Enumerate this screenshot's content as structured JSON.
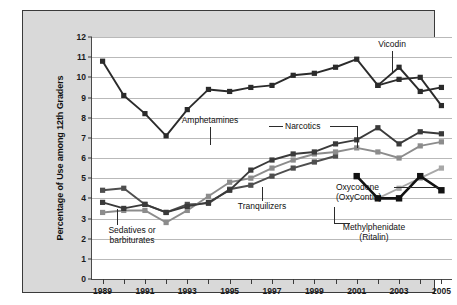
{
  "chart_data": {
    "type": "line",
    "title": "",
    "xlabel": "",
    "ylabel": "Percentage of Use among 12th Graders",
    "xlim": [
      1988.5,
      2005.5
    ],
    "ylim": [
      0,
      12
    ],
    "grid": true,
    "legend_position": "inline-annotations",
    "x": [
      1989,
      1990,
      1991,
      1992,
      1993,
      1994,
      1995,
      1996,
      1997,
      1998,
      1999,
      2000,
      2001,
      2002,
      2003,
      2004,
      2005
    ],
    "ytick_labels": [
      "0",
      "1",
      "2",
      "3",
      "4",
      "5",
      "6",
      "7",
      "8",
      "9",
      "10",
      "11",
      "12"
    ],
    "xtick_labels": [
      "1989",
      "1991",
      "1993",
      "1995",
      "1997",
      "1999",
      "2001",
      "2003",
      "2005"
    ],
    "series": [
      {
        "name": "Amphetamines",
        "color": "#2b2b2b",
        "marker": "square",
        "x": [
          1989,
          1990,
          1991,
          1992,
          1993,
          1994,
          1995,
          1996,
          1997,
          1998,
          1999,
          2000,
          2001,
          2002,
          2003,
          2004,
          2005
        ],
        "values": [
          10.8,
          9.1,
          8.2,
          7.1,
          8.4,
          9.4,
          9.3,
          9.5,
          9.6,
          10.1,
          10.2,
          10.5,
          10.9,
          9.6,
          9.9,
          10.0,
          8.6
        ]
      },
      {
        "name": "Vicodin",
        "color": "#2b2b2b",
        "marker": "square",
        "x": [
          2002,
          2003,
          2004,
          2005
        ],
        "values": [
          9.6,
          10.5,
          9.3,
          9.5
        ]
      },
      {
        "name": "Narcotics",
        "color": "#3a3a3a",
        "marker": "square",
        "x": [
          1989,
          1990,
          1991,
          1992,
          1993,
          1994,
          1995,
          1996,
          1997,
          1998,
          1999,
          2000,
          2001,
          2002,
          2003,
          2004,
          2005
        ],
        "values": [
          3.8,
          3.5,
          3.7,
          3.3,
          3.6,
          3.8,
          4.4,
          5.4,
          5.9,
          6.2,
          6.3,
          6.7,
          6.9,
          7.5,
          6.7,
          7.3,
          7.2
        ]
      },
      {
        "name": "Tranquilizers",
        "color": "#8c8c8c",
        "marker": "square",
        "x": [
          1989,
          1990,
          1991,
          1992,
          1993,
          1994,
          1995,
          1996,
          1997,
          1998,
          1999,
          2000,
          2001,
          2002,
          2003,
          2004,
          2005
        ],
        "values": [
          3.3,
          3.4,
          3.4,
          2.8,
          3.4,
          4.1,
          4.8,
          5.0,
          5.5,
          5.9,
          6.2,
          6.3,
          6.5,
          6.3,
          6.0,
          6.6,
          6.8
        ]
      },
      {
        "name": "Sedatives or barbiturates",
        "color": "#4e4e4e",
        "marker": "square",
        "x": [
          1989,
          1990,
          1991,
          1992,
          1993,
          1994,
          1995,
          1996,
          1997,
          1998,
          1999,
          2000
        ],
        "values": [
          4.4,
          4.5,
          3.7,
          3.3,
          3.7,
          3.75,
          4.45,
          4.65,
          5.1,
          5.5,
          5.8,
          6.1
        ]
      },
      {
        "name": "Oxycodone (OxyContin)",
        "color": "#a8a8a8",
        "marker": "square",
        "x": [
          2002,
          2003,
          2004,
          2005
        ],
        "values": [
          4.0,
          4.5,
          5.0,
          5.5
        ]
      },
      {
        "name": "Methylphenidate (Ritalin)",
        "color": "#121212",
        "marker": "square",
        "x": [
          2001,
          2002,
          2003,
          2004,
          2005
        ],
        "values": [
          5.1,
          4.0,
          4.0,
          5.1,
          4.4
        ]
      }
    ],
    "annotations": [
      {
        "text": "Amphetamines",
        "series": "Amphetamines"
      },
      {
        "text": "Vicodin",
        "series": "Vicodin"
      },
      {
        "text": "Narcotics",
        "series": "Narcotics"
      },
      {
        "text": "Tranquilizers",
        "series": "Tranquilizers"
      },
      {
        "text": "Sedatives or",
        "series": "Sedatives or barbiturates"
      },
      {
        "text": "barbiturates",
        "series": "Sedatives or barbiturates"
      },
      {
        "text": "Oxycodone",
        "series": "Oxycodone (OxyContin)"
      },
      {
        "text": "(OxyContin)",
        "series": "Oxycodone (OxyContin)"
      },
      {
        "text": "Methylphenidate",
        "series": "Methylphenidate (Ritalin)"
      },
      {
        "text": "(Ritalin)",
        "series": "Methylphenidate (Ritalin)"
      }
    ]
  },
  "labels": {
    "amphetamines": "Amphetamines",
    "vicodin": "Vicodin",
    "narcotics": "Narcotics",
    "tranquilizers": "Tranquilizers",
    "sedatives_line1": "Sedatives or",
    "sedatives_line2": "barbiturates",
    "oxycodone_line1": "Oxycodone",
    "oxycodone_line2": "(OxyContin)",
    "ritalin_line1": "Methylphenidate",
    "ritalin_line2": "(Ritalin)"
  },
  "colors": {
    "panel_bg": "#d9d9d9",
    "plot_bg": "#ffffff",
    "frame": "#3a3a3a",
    "grid": "#b9b9b9",
    "dark": "#2b2b2b",
    "mid": "#8c8c8c",
    "light": "#a8a8a8"
  }
}
